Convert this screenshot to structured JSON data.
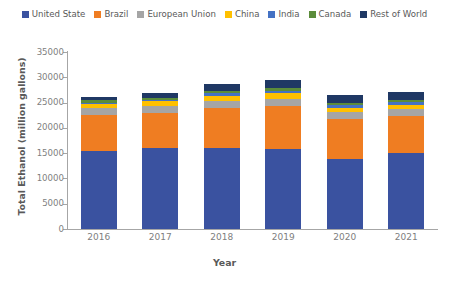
{
  "chart_data": {
    "type": "bar",
    "subtype": "stacked-bar",
    "title": "",
    "xlabel": "Year",
    "ylabel": "Total Ethanol (million gallons)",
    "categories": [
      "2016",
      "2017",
      "2018",
      "2019",
      "2020",
      "2021"
    ],
    "ylim": [
      0,
      35000
    ],
    "ytick_values": [
      0,
      5000,
      10000,
      15000,
      20000,
      25000,
      30000,
      35000
    ],
    "ytick_labels": [
      "0",
      "5000",
      "10000",
      "15000",
      "20000",
      "25000",
      "30000",
      "35000"
    ],
    "grid": false,
    "legend_position": "top-center",
    "series": [
      {
        "name": "United State",
        "color": "#3a52a0",
        "values": [
          15400,
          16100,
          16100,
          15800,
          13900,
          15000
        ]
      },
      {
        "name": "Brazil",
        "color": "#ef7d22",
        "values": [
          7100,
          6900,
          7900,
          8600,
          7900,
          7400
        ]
      },
      {
        "name": "European Union",
        "color": "#a5a5a5",
        "values": [
          1400,
          1400,
          1400,
          1400,
          1300,
          1300
        ]
      },
      {
        "name": "China",
        "color": "#ffc000",
        "values": [
          850,
          850,
          1000,
          1000,
          850,
          850
        ]
      },
      {
        "name": "India",
        "color": "#4472c4",
        "values": [
          250,
          300,
          400,
          500,
          500,
          600
        ]
      },
      {
        "name": "Canada",
        "color": "#5b8c3a",
        "values": [
          450,
          450,
          500,
          500,
          450,
          450
        ]
      },
      {
        "name": "Rest of World",
        "color": "#1f3864",
        "values": [
          750,
          900,
          1400,
          1700,
          1600,
          1500
        ]
      }
    ],
    "totals": [
      26200,
      26900,
      28700,
      29500,
      26500,
      27100
    ]
  },
  "legend": {
    "items": [
      {
        "label": "United State",
        "color": "#3a52a0"
      },
      {
        "label": "Brazil",
        "color": "#ef7d22"
      },
      {
        "label": "European Union",
        "color": "#a5a5a5"
      },
      {
        "label": "China",
        "color": "#ffc000"
      },
      {
        "label": "India",
        "color": "#4472c4"
      },
      {
        "label": "Canada",
        "color": "#5b8c3a"
      },
      {
        "label": "Rest of World",
        "color": "#1f3864"
      }
    ]
  },
  "axes": {
    "x_title": "Year",
    "y_title": "Total Ethanol (million gallons)",
    "axis_color": "#a6a6a6",
    "tick_label_color": "#808080"
  }
}
